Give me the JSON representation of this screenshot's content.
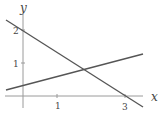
{
  "diagram": {
    "type": "coordinate-plane-two-lines",
    "axes": {
      "x_label": "x",
      "y_label": "y",
      "x_ticks": [
        "1",
        "3"
      ],
      "y_ticks": [
        "1",
        "2"
      ]
    },
    "lines": [
      {
        "name": "decreasing-line",
        "description": "passes through (0,2) and (3,0)"
      },
      {
        "name": "increasing-line",
        "description": "shallow positive slope, y-intercept ≈ 0.3"
      }
    ],
    "colors": {
      "axis": "#9a9a9a",
      "line": "#555555",
      "text": "#444444"
    }
  }
}
